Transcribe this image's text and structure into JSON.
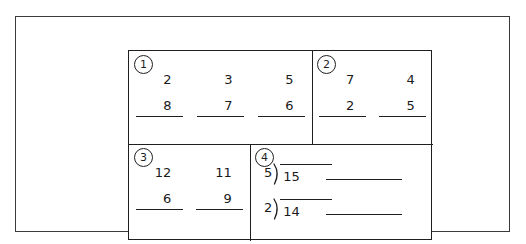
{
  "worksheet": {
    "title": "math-problem-worksheet",
    "ink_color": "#1f1f1f",
    "paper_color": "#ffffff",
    "boxes": [
      {
        "badge": "1",
        "kind": "stacked-pairs",
        "problems": [
          {
            "top": "2",
            "bottom": "8"
          },
          {
            "top": "3",
            "bottom": "7"
          },
          {
            "top": "5",
            "bottom": "6"
          }
        ]
      },
      {
        "badge": "2",
        "kind": "stacked-pairs",
        "problems": [
          {
            "top": "7",
            "bottom": "2"
          },
          {
            "top": "4",
            "bottom": "5"
          }
        ]
      },
      {
        "badge": "3",
        "kind": "stacked-pairs",
        "problems": [
          {
            "top": "12",
            "bottom": "6"
          },
          {
            "top": "11",
            "bottom": "9"
          }
        ]
      },
      {
        "badge": "4",
        "kind": "long-division",
        "problems": [
          {
            "divisor": "5",
            "dividend": "15",
            "answer": ""
          },
          {
            "divisor": "2",
            "dividend": "14",
            "answer": ""
          }
        ]
      }
    ]
  }
}
